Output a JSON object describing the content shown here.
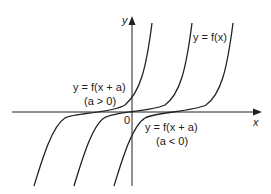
{
  "axes": {
    "x_label": "x",
    "y_label": "y",
    "origin_label": "0"
  },
  "curves": [
    {
      "id": "shift-left",
      "label": "y = f(x + a)",
      "condition": "(a > 0)"
    },
    {
      "id": "original",
      "label": "y = f(x)"
    },
    {
      "id": "shift-right",
      "label": "y = f(x + a)",
      "condition": "(a < 0)"
    }
  ],
  "labels": {
    "original": "y = f(x)",
    "left_eq": "y = f(x + a)",
    "left_cond": "(a > 0)",
    "right_eq": "y = f(x + a)",
    "right_cond": "(a < 0)"
  },
  "colors": {
    "stroke": "#222222",
    "background": "#ffffff"
  }
}
